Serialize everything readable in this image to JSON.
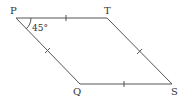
{
  "diagram": {
    "type": "rhombus",
    "vertices": {
      "P": {
        "label": "P",
        "x": 16,
        "y": 18
      },
      "T": {
        "label": "T",
        "x": 107,
        "y": 18
      },
      "S": {
        "label": "S",
        "x": 172,
        "y": 84
      },
      "Q": {
        "label": "Q",
        "x": 80,
        "y": 84
      }
    },
    "angle": {
      "vertex": "P",
      "label": "45°"
    },
    "equal_side_marks": [
      "PT",
      "TS",
      "SQ",
      "QP"
    ],
    "line_color": "#555555"
  }
}
